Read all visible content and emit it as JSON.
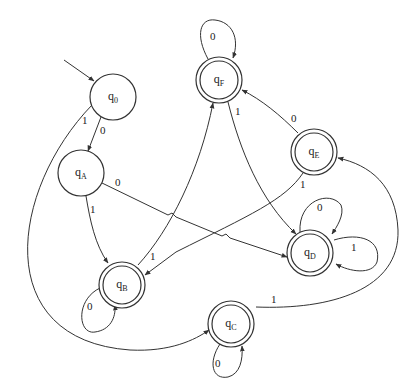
{
  "diagram": {
    "type": "finite-automaton",
    "states": [
      {
        "id": "q0",
        "label": "q",
        "sub": "0",
        "accepting": false,
        "initial": true
      },
      {
        "id": "qA",
        "label": "q",
        "sub": "A",
        "accepting": false,
        "initial": false
      },
      {
        "id": "qB",
        "label": "q",
        "sub": "B",
        "accepting": true,
        "initial": false
      },
      {
        "id": "qC",
        "label": "q",
        "sub": "C",
        "accepting": true,
        "initial": false
      },
      {
        "id": "qD",
        "label": "q",
        "sub": "D",
        "accepting": true,
        "initial": false
      },
      {
        "id": "qE",
        "label": "q",
        "sub": "E",
        "accepting": true,
        "initial": false
      },
      {
        "id": "qF",
        "label": "q",
        "sub": "F",
        "accepting": true,
        "initial": false
      }
    ],
    "transitions": [
      {
        "from": "q0",
        "to": "qA",
        "label": "0"
      },
      {
        "from": "q0",
        "to": "qC",
        "label": "1"
      },
      {
        "from": "qA",
        "to": "qD",
        "label": "0"
      },
      {
        "from": "qA",
        "to": "qB",
        "label": "1"
      },
      {
        "from": "qB",
        "to": "qB",
        "label": "0"
      },
      {
        "from": "qB",
        "to": "qF",
        "label": "1"
      },
      {
        "from": "qC",
        "to": "qC",
        "label": "0"
      },
      {
        "from": "qC",
        "to": "qE",
        "label": "1"
      },
      {
        "from": "qD",
        "to": "qD",
        "label": "0"
      },
      {
        "from": "qD",
        "to": "qD",
        "label": "1"
      },
      {
        "from": "qE",
        "to": "qF",
        "label": "0"
      },
      {
        "from": "qE",
        "to": "qB",
        "label": "1"
      },
      {
        "from": "qF",
        "to": "qF",
        "label": "0"
      },
      {
        "from": "qF",
        "to": "qD",
        "label": "1"
      }
    ]
  }
}
